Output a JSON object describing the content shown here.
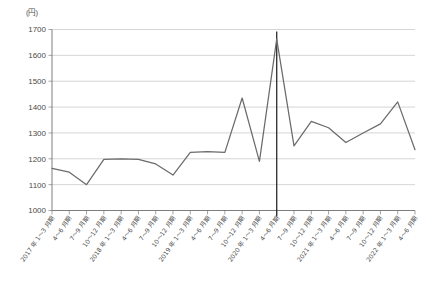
{
  "axis_unit_label": "(円)",
  "chart_data": {
    "type": "line",
    "title": "",
    "subtitle": "",
    "xlabel": "",
    "ylabel": "(円)",
    "ylim": [
      1000,
      1700
    ],
    "ytick_step": 100,
    "yticks": [
      1000,
      1100,
      1200,
      1300,
      1400,
      1500,
      1600,
      1700
    ],
    "ytick_labels": [
      "1000",
      "1100",
      "1200",
      "1300",
      "1400",
      "1500",
      "1600",
      "1700"
    ],
    "grid": true,
    "legend": "none",
    "categories": [
      "2017 年 1～3 月期",
      "4～6 月期",
      "7～9 月期",
      "10～12 月期",
      "2018 年 1～3 月期",
      "4～6 月期",
      "7～9 月期",
      "10～12 月期",
      "2019 年 1～3 月期",
      "4～6 月期",
      "7～9 月期",
      "10～12 月期",
      "2020 年 1～3 月期",
      "4～6 月期",
      "7～9 月期",
      "10～12 月期",
      "2021 年 1～3 月期",
      "4～6 月期",
      "7～9 月期",
      "10～12 月期",
      "2022 年 1～3 月期",
      "4～6 月期"
    ],
    "series": [
      {
        "name": "価格",
        "values": [
          1163,
          1148,
          1100,
          1198,
          1200,
          1198,
          1180,
          1137,
          1225,
          1228,
          1225,
          1435,
          1190,
          1663,
          1250,
          1345,
          1320,
          1263,
          1300,
          1335,
          1420,
          1235
        ]
      }
    ],
    "annotations": [
      {
        "type": "vertical-reference-line",
        "at_category_index": 13,
        "label": ""
      }
    ]
  }
}
